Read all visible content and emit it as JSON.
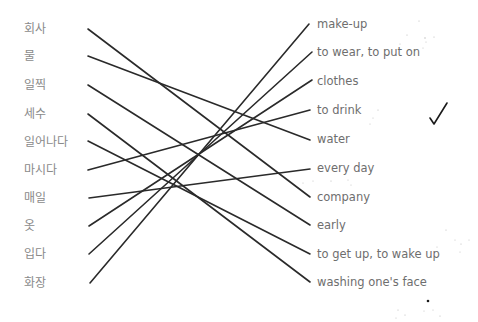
{
  "exercise": {
    "left_words": [
      {
        "text": "회사",
        "y": 29
      },
      {
        "text": "물",
        "y": 56
      },
      {
        "text": "일찍",
        "y": 85
      },
      {
        "text": "세수",
        "y": 114
      },
      {
        "text": "일어나다",
        "y": 141
      },
      {
        "text": "마시다",
        "y": 170
      },
      {
        "text": "매일",
        "y": 198
      },
      {
        "text": "옷",
        "y": 226
      },
      {
        "text": "입다",
        "y": 254
      },
      {
        "text": "화장",
        "y": 283
      }
    ],
    "right_words": [
      {
        "text": "make-up",
        "y": 24
      },
      {
        "text": "to wear, to put on",
        "y": 52
      },
      {
        "text": "clothes",
        "y": 80
      },
      {
        "text": "to drink",
        "y": 110
      },
      {
        "text": "water",
        "y": 140
      },
      {
        "text": "every day",
        "y": 169
      },
      {
        "text": "company",
        "y": 197
      },
      {
        "text": "early",
        "y": 225
      },
      {
        "text": "to get up, to wake up",
        "y": 254
      },
      {
        "text": "washing one's face",
        "y": 282
      }
    ],
    "connections": [
      {
        "from": "회사",
        "to": "company"
      },
      {
        "from": "물",
        "to": "water"
      },
      {
        "from": "일찍",
        "to": "early"
      },
      {
        "from": "세수",
        "to": "washing one's face"
      },
      {
        "from": "일어나다",
        "to": "to get up, to wake up"
      },
      {
        "from": "마시다",
        "to": "to drink"
      },
      {
        "from": "매일",
        "to": "every day"
      },
      {
        "from": "옷",
        "to": "clothes"
      },
      {
        "from": "입다",
        "to": "to wear, to put on"
      },
      {
        "from": "화장",
        "to": "make-up"
      }
    ],
    "line_color": "#2a2a2a",
    "check_mark": "✓"
  }
}
